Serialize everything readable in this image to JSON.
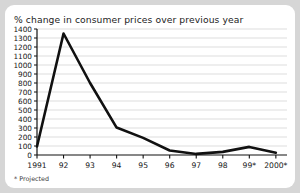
{
  "figure": {
    "title": "% change in consumer prices over previous year",
    "footnote": "* Projected",
    "background_color": "#d6d6d6",
    "panel_color": "#ffffff",
    "line_color": "#111111",
    "grid_color": "#cfcfcf",
    "axis_color": "#111111"
  },
  "chart_data": {
    "type": "line",
    "title": "% change in consumer prices over previous year",
    "xlabel": "",
    "ylabel": "",
    "categories": [
      "1991",
      "92",
      "93",
      "94",
      "95",
      "96",
      "97",
      "98",
      "99*",
      "2000*"
    ],
    "values": [
      95,
      1350,
      800,
      305,
      190,
      50,
      12,
      35,
      90,
      25
    ],
    "series": [
      {
        "name": "% change in consumer prices over previous year",
        "values": [
          95,
          1350,
          800,
          305,
          190,
          50,
          12,
          35,
          90,
          25
        ]
      }
    ],
    "ylim": [
      0,
      1400
    ],
    "ytick_values": [
      0,
      100,
      200,
      300,
      400,
      500,
      600,
      700,
      800,
      900,
      1000,
      1100,
      1200,
      1300,
      1400
    ],
    "ytick_labels": [
      "0",
      "100",
      "200",
      "300",
      "400",
      "500",
      "600",
      "700",
      "800",
      "900",
      "1000",
      "1100",
      "1200",
      "1300",
      "1400"
    ],
    "xtick_labels": [
      "1991",
      "92",
      "93",
      "94",
      "95",
      "96",
      "97",
      "98",
      "99*",
      "2000*"
    ],
    "grid": true,
    "grid_axis": "y",
    "legend": false,
    "annotations": [
      "* Projected"
    ]
  }
}
